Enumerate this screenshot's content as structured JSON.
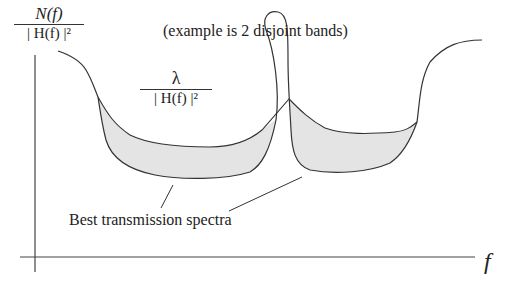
{
  "diagram": {
    "y_axis_label": {
      "numerator": "N(f)",
      "denominator": "| H(f) |²"
    },
    "water_level_label": {
      "numerator": "λ",
      "denominator": "| H(f) |²"
    },
    "annotation": "(example is 2 disjoint bands)",
    "callout": "Best transmission spectra",
    "x_axis_label": "f",
    "colors": {
      "stroke": "#333333",
      "fill": "#e4e4e4",
      "background": "#ffffff"
    }
  }
}
